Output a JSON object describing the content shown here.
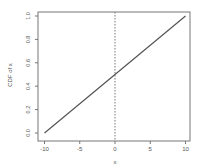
{
  "chart_data": {
    "type": "line",
    "title": "",
    "xlabel": "x",
    "ylabel": "CDF of x",
    "xlim": [
      -10.6,
      10.6
    ],
    "ylim": [
      -0.04,
      1.04
    ],
    "x_ticks": [
      -10,
      -5,
      0,
      5,
      10
    ],
    "x_tick_labels": [
      "-10",
      "-5",
      "0",
      "5",
      "10"
    ],
    "y_ticks": [
      0.0,
      0.2,
      0.4,
      0.6,
      0.8,
      1.0
    ],
    "y_tick_labels": [
      "0.0",
      "0.2",
      "0.4",
      "0.6",
      "0.8",
      "1.0"
    ],
    "grid": false,
    "legend": null,
    "series": [
      {
        "name": "CDF of x",
        "style": "solid",
        "color": "#555555",
        "x": [
          -10,
          -5,
          0,
          5,
          10
        ],
        "y": [
          0.0,
          0.25,
          0.5,
          0.75,
          1.0
        ]
      }
    ],
    "annotations": [
      {
        "type": "vline",
        "x": 0,
        "style": "dotted",
        "color": "#777777"
      }
    ]
  },
  "colors": {
    "axis": "#777777",
    "line": "#555555",
    "text": "#555555",
    "background": "#ffffff"
  }
}
